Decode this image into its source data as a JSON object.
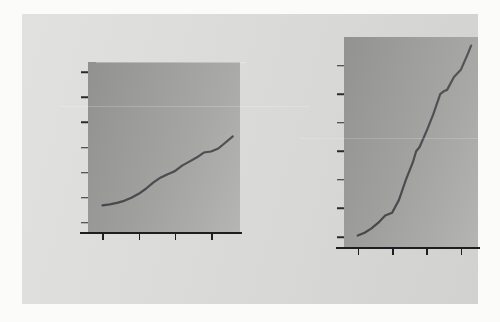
{
  "figure": {
    "background_color": "#d9d9d7",
    "page_color": "#fbfbfa",
    "plot_fill_color": "#9e9e9c",
    "line_color": "#4a4a50",
    "axis_color": "#1e1e22"
  },
  "chart_data": [
    {
      "id": "left",
      "type": "line",
      "title": "",
      "xlabel": "Year",
      "ylabel": "Divorced women per 1000 married women",
      "xlim": [
        1956,
        1998
      ],
      "ylim": [
        -18,
        320
      ],
      "xticks": [
        1960,
        1970,
        1980,
        1990
      ],
      "xtick_labels": [
        "1960",
        "1970",
        "1980",
        "1990"
      ],
      "yticks": [
        0,
        50,
        100,
        150,
        200,
        250,
        300
      ],
      "ytick_labels": [
        "0",
        "50",
        "100",
        "150",
        "200",
        "250",
        "300"
      ],
      "grid": false,
      "legend": "none",
      "x": [
        1960,
        1962,
        1964,
        1966,
        1968,
        1970,
        1972,
        1974,
        1976,
        1978,
        1979,
        1980,
        1982,
        1984,
        1986,
        1988,
        1990,
        1992,
        1994,
        1996
      ],
      "values": [
        35,
        37,
        40,
        44,
        50,
        58,
        68,
        80,
        90,
        97,
        100,
        103,
        114,
        122,
        130,
        140,
        142,
        148,
        160,
        172
      ]
    },
    {
      "id": "right",
      "type": "line",
      "title": "",
      "xlabel": "Year",
      "ylabel": "Divorced women per 1000 married women",
      "xlim": [
        1956,
        1995
      ],
      "ylim": [
        33,
        180
      ],
      "xticks": [
        1960,
        1970,
        1980,
        1990
      ],
      "xtick_labels": [
        "1960",
        "1970",
        "1980",
        "1990"
      ],
      "yticks": [
        40,
        60,
        80,
        100,
        120,
        140,
        160
      ],
      "ytick_labels": [
        "40",
        "60",
        "80",
        "100",
        "120",
        "140",
        "160"
      ],
      "grid": false,
      "legend": "none",
      "x": [
        1960,
        1962,
        1964,
        1966,
        1968,
        1970,
        1972,
        1974,
        1976,
        1977,
        1978,
        1980,
        1982,
        1984,
        1985,
        1986,
        1988,
        1990,
        1992,
        1993
      ],
      "values": [
        41,
        43,
        46,
        50,
        55,
        57,
        66,
        80,
        92,
        100,
        103,
        114,
        126,
        140,
        142,
        143,
        152,
        157,
        168,
        174
      ]
    }
  ]
}
